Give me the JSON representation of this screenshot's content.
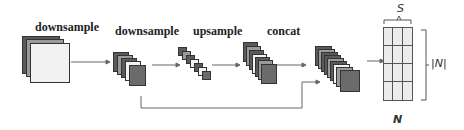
{
  "diagram": {
    "stages": [
      {
        "label": "downsample",
        "sheets": 3
      },
      {
        "label": "downsample",
        "sheets": 5
      },
      {
        "label": "upsample",
        "sheets": 7
      },
      {
        "label": "concat",
        "sheets": 7
      },
      {
        "label": "",
        "sheets": 9
      }
    ],
    "output_matrix": {
      "name": "N",
      "width_label": "S",
      "height_label": "|N|",
      "rows": 4,
      "cols": 3
    },
    "skip_connection": {
      "from_stage": 1,
      "to_stage": 4
    },
    "colors": {
      "dark_sheet": "#5a5a5a",
      "light_sheet": "#f2f2f2",
      "line": "#666666"
    }
  }
}
